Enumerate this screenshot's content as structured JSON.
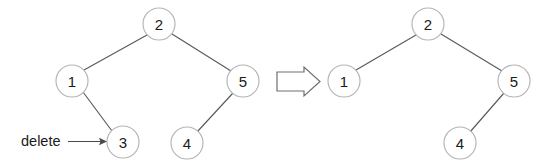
{
  "diagram": {
    "background_color": "#ffffff",
    "node_stroke_color": "#b4b4b4",
    "edge_stroke_color": "#5a5a5a",
    "label_color": "#1a1a1a",
    "annotation": {
      "label": "delete",
      "target_node": "3",
      "pointer_icon": "arrow-right-icon"
    },
    "transition": {
      "icon": "block-arrow-right-icon",
      "from": "before-tree",
      "to": "after-tree"
    },
    "before_tree": {
      "name": "Tree before deletion",
      "nodes": [
        {
          "id": "b2",
          "label": "2",
          "cx": 159,
          "cy": 24,
          "r": 16
        },
        {
          "id": "b1",
          "label": "1",
          "cx": 72,
          "cy": 81,
          "r": 16
        },
        {
          "id": "b5",
          "label": "5",
          "cx": 243,
          "cy": 81,
          "r": 16
        },
        {
          "id": "b3",
          "label": "3",
          "cx": 123,
          "cy": 142,
          "r": 16
        },
        {
          "id": "b4",
          "label": "4",
          "cx": 187,
          "cy": 143,
          "r": 16
        }
      ],
      "edges": [
        {
          "from": "b2",
          "to": "b1"
        },
        {
          "from": "b2",
          "to": "b5"
        },
        {
          "from": "b1",
          "to": "b3"
        },
        {
          "from": "b5",
          "to": "b4"
        }
      ]
    },
    "after_tree": {
      "name": "Tree after deletion",
      "nodes": [
        {
          "id": "a2",
          "label": "2",
          "cx": 428,
          "cy": 24,
          "r": 16
        },
        {
          "id": "a1",
          "label": "1",
          "cx": 344,
          "cy": 81,
          "r": 16
        },
        {
          "id": "a5",
          "label": "5",
          "cx": 514,
          "cy": 81,
          "r": 16
        },
        {
          "id": "a4",
          "label": "4",
          "cx": 460,
          "cy": 143,
          "r": 16
        }
      ],
      "edges": [
        {
          "from": "a2",
          "to": "a1"
        },
        {
          "from": "a2",
          "to": "a5"
        },
        {
          "from": "a5",
          "to": "a4"
        }
      ]
    }
  }
}
